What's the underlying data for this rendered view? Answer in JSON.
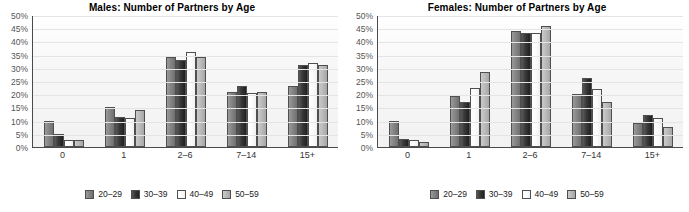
{
  "chart_data": [
    {
      "type": "bar",
      "title": "Males: Number of Partners by Age",
      "xlabel": "",
      "ylabel": "",
      "categories": [
        "0",
        "1",
        "2–6",
        "7–14",
        "15+"
      ],
      "ylim": [
        0,
        50
      ],
      "ytick_labels": [
        "50%",
        "45%",
        "40%",
        "35%",
        "30%",
        "25%",
        "20%",
        "15%",
        "10%",
        "5%",
        "0%"
      ],
      "ytick_values": [
        50,
        45,
        40,
        35,
        30,
        25,
        20,
        15,
        10,
        5,
        0
      ],
      "grid": true,
      "legend_position": "bottom",
      "series": [
        {
          "name": "20–29",
          "color": "#8a8a8a",
          "values": [
            10,
            15,
            34,
            21,
            23
          ]
        },
        {
          "name": "30–39",
          "color": "#2b2b2b",
          "values": [
            5,
            11.5,
            33,
            23,
            31
          ]
        },
        {
          "name": "40–49",
          "color": "#f7f7f7",
          "values": [
            2.5,
            11,
            36,
            20.5,
            32
          ]
        },
        {
          "name": "50–59",
          "color": "#bdbdbd",
          "values": [
            2.5,
            14,
            34,
            21,
            31
          ]
        }
      ]
    },
    {
      "type": "bar",
      "title": "Females: Number of Partners by Age",
      "xlabel": "",
      "ylabel": "",
      "categories": [
        "0",
        "1",
        "2–6",
        "7–14",
        "15+"
      ],
      "ylim": [
        0,
        50
      ],
      "ytick_labels": [
        "50%",
        "45%",
        "40%",
        "35%",
        "30%",
        "25%",
        "20%",
        "15%",
        "10%",
        "5%",
        "0%"
      ],
      "ytick_values": [
        50,
        45,
        40,
        35,
        30,
        25,
        20,
        15,
        10,
        5,
        0
      ],
      "grid": true,
      "legend_position": "bottom",
      "series": [
        {
          "name": "20–29",
          "color": "#8a8a8a",
          "values": [
            10,
            19.5,
            44,
            20,
            9
          ]
        },
        {
          "name": "30–39",
          "color": "#2b2b2b",
          "values": [
            3,
            17,
            43,
            26,
            12
          ]
        },
        {
          "name": "40–49",
          "color": "#f7f7f7",
          "values": [
            2.5,
            22.5,
            43,
            22,
            11
          ]
        },
        {
          "name": "50–59",
          "color": "#bdbdbd",
          "values": [
            2,
            28.5,
            46,
            17,
            7.5
          ]
        }
      ]
    }
  ]
}
